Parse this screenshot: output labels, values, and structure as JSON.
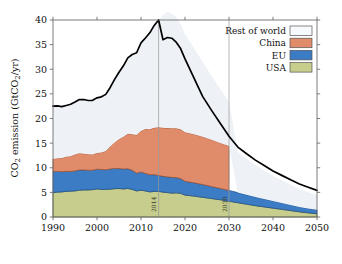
{
  "chart_data": {
    "type": "area",
    "title": "",
    "subtitle": "",
    "xlabel": "",
    "ylabel": "CO2 emission (GtCO2/yr)",
    "ylabel_parts": {
      "pre": "CO",
      "sub1": "2",
      "mid": " emission (GtCO",
      "sub2": "2",
      "post": "/yr)"
    },
    "xlim": [
      1990,
      2050
    ],
    "ylim": [
      0,
      40
    ],
    "xticks": [
      1990,
      2000,
      2010,
      2020,
      2030,
      2040,
      2050
    ],
    "yticks": [
      0,
      5,
      10,
      15,
      20,
      25,
      30,
      35,
      40
    ],
    "grid": false,
    "stacked": true,
    "legend_position": "top-right",
    "x": [
      1990,
      1991,
      1992,
      1993,
      1994,
      1995,
      1996,
      1997,
      1998,
      1999,
      2000,
      2001,
      2002,
      2003,
      2004,
      2005,
      2006,
      2007,
      2008,
      2009,
      2010,
      2011,
      2012,
      2013,
      2014,
      2015,
      2016,
      2017,
      2018,
      2019,
      2020,
      2022,
      2024,
      2026,
      2028,
      2030,
      2032,
      2034,
      2036,
      2038,
      2040,
      2042,
      2044,
      2046,
      2048,
      2050
    ],
    "series": [
      {
        "name": "USA",
        "color": "#c7cd8c",
        "edge_color": "#4c5a2c",
        "x_end": 2050,
        "values": [
          4.95,
          5.05,
          5.1,
          5.2,
          5.25,
          5.3,
          5.45,
          5.5,
          5.5,
          5.55,
          5.7,
          5.6,
          5.6,
          5.65,
          5.75,
          5.78,
          5.7,
          5.8,
          5.6,
          5.3,
          5.45,
          5.3,
          5.1,
          5.2,
          5.2,
          5.05,
          4.95,
          4.85,
          4.9,
          4.8,
          4.45,
          4.25,
          4.0,
          3.75,
          3.5,
          3.2,
          2.9,
          2.6,
          2.3,
          2.05,
          1.8,
          1.55,
          1.3,
          1.05,
          0.85,
          0.65
        ]
      },
      {
        "name": "EU",
        "color": "#3b7cc4",
        "edge_color": "#1d4d86",
        "x_end": 2050,
        "values": [
          4.3,
          4.2,
          4.1,
          4.05,
          4.0,
          4.05,
          4.1,
          4.05,
          4.0,
          3.95,
          4.0,
          4.05,
          4.0,
          4.1,
          4.1,
          4.05,
          4.05,
          4.0,
          3.9,
          3.6,
          3.7,
          3.55,
          3.5,
          3.4,
          3.25,
          3.2,
          3.2,
          3.2,
          3.1,
          3.0,
          2.8,
          2.7,
          2.6,
          2.45,
          2.3,
          2.2,
          2.05,
          1.9,
          1.75,
          1.6,
          1.45,
          1.3,
          1.15,
          1.0,
          0.9,
          0.8
        ]
      },
      {
        "name": "China",
        "color": "#e08c6b",
        "edge_color": "#9c4e2c",
        "x_end": 2030,
        "values": [
          2.55,
          2.7,
          2.8,
          3.0,
          3.1,
          3.35,
          3.4,
          3.3,
          3.25,
          3.2,
          3.3,
          3.45,
          3.8,
          4.55,
          5.3,
          5.95,
          6.55,
          7.1,
          7.3,
          7.75,
          8.3,
          9.0,
          9.2,
          9.5,
          9.75,
          9.85,
          9.9,
          9.95,
          10.0,
          10.0,
          9.95,
          9.85,
          9.7,
          9.5,
          9.25,
          9.0,
          null,
          null,
          null,
          null,
          null,
          null,
          null,
          null,
          null,
          null
        ]
      },
      {
        "name": "Rest of world",
        "color": "#eef2f7",
        "edge_color": "#000000",
        "x_end": 2050,
        "values": [
          10.7,
          10.6,
          10.4,
          10.4,
          10.55,
          10.65,
          10.9,
          11.0,
          10.9,
          11.0,
          11.2,
          11.3,
          11.5,
          12.0,
          12.8,
          13.6,
          14.4,
          15.4,
          16.2,
          16.7,
          17.9,
          18.5,
          19.6,
          20.8,
          21.8,
          22.9,
          23.6,
          23.3,
          22.5,
          21.4,
          19.9,
          17.5,
          15.2,
          13.0,
          11.0,
          9.0,
          8.25,
          7.35,
          6.5,
          5.8,
          5.1,
          4.6,
          4.1,
          3.65,
          3.3,
          2.95
        ]
      }
    ],
    "total_curve": {
      "name": "Total CO2 emission",
      "color": "#000000",
      "values": [
        22.5,
        22.55,
        22.4,
        22.65,
        22.9,
        23.35,
        23.85,
        23.85,
        23.65,
        23.7,
        24.2,
        24.4,
        24.9,
        26.3,
        27.95,
        29.38,
        30.7,
        32.3,
        33.0,
        33.35,
        35.35,
        36.35,
        37.4,
        38.9,
        40.0,
        36.0,
        36.45,
        36.3,
        35.5,
        34.2,
        32.1,
        28.3,
        24.5,
        21.7,
        19.05,
        16.4,
        14.2,
        12.85,
        11.55,
        10.45,
        9.35,
        8.45,
        7.55,
        6.7,
        6.05,
        5.4
      ]
    },
    "annotations": [
      {
        "name": "vline-2014",
        "x": 2014,
        "label": "2014",
        "orientation": "vertical",
        "color": "#9a9a9a"
      },
      {
        "name": "vline-2030",
        "x": 2030,
        "label": "2030",
        "orientation": "vertical",
        "color": "#9a9a9a"
      }
    ],
    "legend": [
      {
        "label": "Rest of world",
        "color": "#f7fafd",
        "border": "#555555"
      },
      {
        "label": "China",
        "color": "#e08c6b",
        "border": "#555555"
      },
      {
        "label": "EU",
        "color": "#3b7cc4",
        "border": "#555555"
      },
      {
        "label": "USA",
        "color": "#c7cd8c",
        "border": "#555555"
      }
    ]
  },
  "axes": {
    "x_tick_labels": [
      "1990",
      "2000",
      "2010",
      "2020",
      "2030",
      "2040",
      "2050"
    ],
    "y_tick_labels": [
      "0",
      "5",
      "10",
      "15",
      "20",
      "25",
      "30",
      "35",
      "40"
    ]
  }
}
